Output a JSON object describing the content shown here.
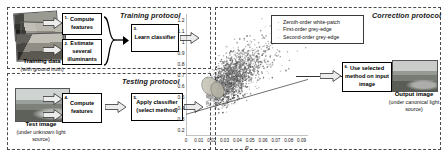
{
  "panels": {
    "training": {
      "title": "Training protocol"
    },
    "testing": {
      "title": "Testing protocol"
    },
    "correction": {
      "title": "Correction protocol"
    }
  },
  "boxes": {
    "compute_features_train": {
      "num": "1.",
      "text": "Compute features"
    },
    "estimate_illuminants": {
      "num": "2.",
      "text": "Estimate several illuminants"
    },
    "learn_classifier": {
      "num": "3.",
      "text": "Learn classifier"
    },
    "compute_features_test": {
      "num": "4.",
      "text": "Compute features"
    },
    "apply_classifier": {
      "num": "5.",
      "text": "Apply classifier (select method)"
    },
    "use_selected_method": {
      "num": "6.",
      "text": "Use selected method on input image"
    }
  },
  "captions": {
    "training_data": {
      "title": "Training data",
      "sub": "(with ground truth)"
    },
    "test_image": {
      "title": "Test image",
      "sub": "(under unknown light source)"
    },
    "output_image": {
      "title": "Output image",
      "sub": "(under canonical light source)"
    }
  },
  "legend": {
    "items": [
      {
        "marker": "·",
        "label": "Zeroth-order white-patch"
      },
      {
        "marker": "·",
        "label": "First-order grey-edge"
      },
      {
        "marker": "·",
        "label": "Second-order grey-edge"
      }
    ]
  },
  "chart_data": {
    "type": "scatter",
    "title": "",
    "xlabel": "p",
    "ylabel": "",
    "xlim": [
      0,
      0.095
    ],
    "ylim": [
      0.15,
      1.25
    ],
    "grid": false,
    "legend_position": "top-right",
    "xticks": [
      "0",
      "0.01",
      "0.02",
      "0.03",
      "0.04",
      "0.05",
      "0.06",
      "0.07",
      "0.08",
      "0.09"
    ],
    "xtick_values": [
      0,
      0.01,
      0.02,
      0.03,
      0.04,
      0.05,
      0.06,
      0.07,
      0.08,
      0.09
    ],
    "yticks": [
      "1.2",
      "1.1",
      "1",
      "0.9",
      "0.8",
      "0.7",
      "0.6",
      "0.5",
      "0.4",
      "0.3",
      "0.2"
    ],
    "ytick_values": [
      1.2,
      1.1,
      1.0,
      0.9,
      0.8,
      0.7,
      0.6,
      0.5,
      0.4,
      0.3,
      0.2
    ],
    "series": [
      {
        "name": "Zeroth-order white-patch",
        "marker": "dot",
        "color": "#3a3a3a",
        "cluster_center": [
          0.028,
          0.6
        ],
        "cluster_spread": [
          0.016,
          0.17
        ],
        "n_points": 900
      },
      {
        "name": "First-order grey-edge",
        "marker": "dot",
        "color": "#707070",
        "cluster_center": [
          0.038,
          0.72
        ],
        "cluster_spread": [
          0.02,
          0.2
        ],
        "n_points": 700
      },
      {
        "name": "Second-order grey-edge",
        "marker": "dot",
        "color": "#9a9a9a",
        "cluster_center": [
          0.02,
          0.55
        ],
        "cluster_spread": [
          0.012,
          0.14
        ],
        "n_points": 500
      }
    ],
    "annotations": [
      {
        "type": "ellipse",
        "center": [
          0.0185,
          0.6
        ],
        "rx": 0.006,
        "ry": 0.085,
        "angle": -28,
        "fill": "#c9c6ba"
      },
      {
        "type": "ellipse",
        "center": [
          0.0245,
          0.565
        ],
        "rx": 0.005,
        "ry": 0.075,
        "angle": -18,
        "fill": "#b5b2a6"
      },
      {
        "type": "line",
        "from": [
          0.0,
          0.345
        ],
        "to": [
          0.095,
          0.66
        ]
      }
    ]
  },
  "colors": {
    "panel_border": "#4a4a4a",
    "box_border": "#000000",
    "arrow_fill": "#e9e9e9",
    "arrow_stroke": "#333333",
    "text": "#111111"
  }
}
